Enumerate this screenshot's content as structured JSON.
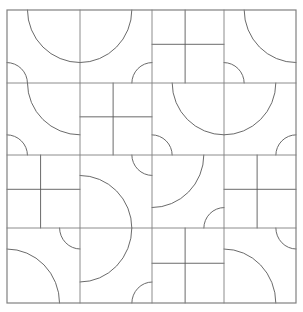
{
  "figure": {
    "type": "tiling-diagram",
    "background_color": "#ffffff",
    "stroke_color": "#595959",
    "stroke_color_border": "#808080",
    "stroke_width": 0.9,
    "border_stroke_width": 1.2
  },
  "canvas": {
    "width": 303,
    "height": 312
  },
  "grid": {
    "rows": 4,
    "cols": 4,
    "x_lines": [
      7,
      80,
      152,
      224,
      296
    ],
    "y_lines": [
      10,
      83,
      155,
      228,
      303
    ],
    "left": 7,
    "top": 10,
    "right": 296,
    "bottom": 303
  },
  "tile_geometry": {
    "arc_large_radius_ratio": 0.72,
    "arc_small_radius_ratio": 0.28,
    "cross_vertical_ratio": 0.46,
    "cross_horizontal_ratio": 0.47
  },
  "tiles": [
    [
      {
        "kind": "arc",
        "corner": "tr"
      },
      {
        "kind": "arc",
        "corner": "tl"
      },
      {
        "kind": "cross"
      },
      {
        "kind": "arc",
        "corner": "tr"
      }
    ],
    [
      {
        "kind": "arc",
        "corner": "tr"
      },
      {
        "kind": "cross"
      },
      {
        "kind": "arc",
        "corner": "tr"
      },
      {
        "kind": "arc",
        "corner": "tl"
      }
    ],
    [
      {
        "kind": "cross"
      },
      {
        "kind": "arc",
        "corner": "bl"
      },
      {
        "kind": "arc",
        "corner": "tl"
      },
      {
        "kind": "cross"
      }
    ],
    [
      {
        "kind": "arc",
        "corner": "bl"
      },
      {
        "kind": "arc",
        "corner": "tl"
      },
      {
        "kind": "cross"
      },
      {
        "kind": "arc",
        "corner": "bl"
      }
    ]
  ],
  "legend": {
    "arc_tile_label": "arc tile",
    "cross_tile_label": "cross tile"
  }
}
